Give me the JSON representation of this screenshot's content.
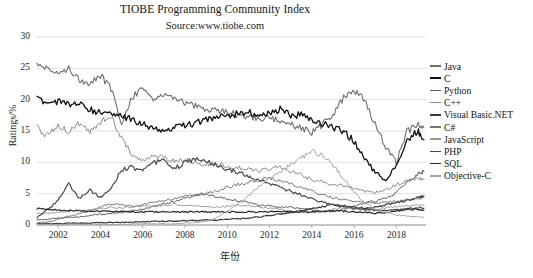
{
  "chart_data": {
    "type": "line",
    "title": "TIOBE Programming Community Index",
    "subtitle": "Source:www.tiobe.com",
    "xlabel": "年份",
    "ylabel": "Ratings/%",
    "xlim": [
      2001.0,
      2019.4
    ],
    "ylim": [
      0,
      30
    ],
    "yticks": [
      0,
      5,
      10,
      15,
      20,
      25,
      30
    ],
    "xticks": [
      2002,
      2004,
      2006,
      2008,
      2010,
      2012,
      2014,
      2016,
      2018
    ],
    "grid": true,
    "grid_axis": "y",
    "legend_position": "right",
    "x": [
      2001.0,
      2001.5,
      2002.0,
      2002.5,
      2003.0,
      2003.5,
      2004.0,
      2004.5,
      2005.0,
      2005.5,
      2006.0,
      2006.5,
      2007.0,
      2007.5,
      2008.0,
      2008.5,
      2009.0,
      2009.5,
      2010.0,
      2010.5,
      2011.0,
      2011.5,
      2012.0,
      2012.5,
      2013.0,
      2013.5,
      2014.0,
      2014.5,
      2015.0,
      2015.5,
      2016.0,
      2016.5,
      2017.0,
      2017.5,
      2018.0,
      2018.5,
      2019.0,
      2019.3
    ],
    "series": [
      {
        "name": "Java",
        "color": "#6f6f6f",
        "width": 1.1,
        "values": [
          26.0,
          24.8,
          24.2,
          25.1,
          23.3,
          22.6,
          23.9,
          21.8,
          16.4,
          20.5,
          21.9,
          20.0,
          21.0,
          20.4,
          19.6,
          19.0,
          18.5,
          18.2,
          18.0,
          17.5,
          17.2,
          17.0,
          17.2,
          16.6,
          16.2,
          15.4,
          14.8,
          16.0,
          17.8,
          20.3,
          21.5,
          20.0,
          16.0,
          12.5,
          10.0,
          14.9,
          16.0,
          15.5
        ]
      },
      {
        "name": "C",
        "color": "#101010",
        "width": 1.3,
        "values": [
          20.2,
          19.4,
          19.8,
          19.1,
          19.5,
          18.4,
          18.0,
          17.6,
          17.3,
          16.8,
          16.1,
          15.6,
          14.6,
          15.5,
          15.9,
          16.2,
          16.8,
          17.2,
          17.4,
          17.8,
          18.1,
          17.5,
          17.8,
          18.5,
          17.4,
          17.6,
          16.9,
          16.2,
          15.6,
          15.0,
          13.4,
          10.5,
          8.4,
          7.2,
          9.5,
          13.4,
          15.1,
          13.6
        ]
      },
      {
        "name": "Python",
        "color": "#5a5a5a",
        "width": 1.0,
        "values": [
          0.8,
          0.9,
          1.1,
          1.2,
          1.3,
          1.5,
          1.7,
          1.8,
          2.0,
          2.3,
          2.5,
          2.9,
          3.4,
          3.8,
          4.3,
          4.7,
          4.9,
          4.5,
          4.2,
          3.9,
          3.6,
          3.2,
          3.0,
          2.8,
          2.9,
          2.6,
          2.4,
          2.2,
          2.1,
          2.4,
          3.1,
          3.5,
          3.8,
          4.2,
          5.2,
          6.8,
          8.2,
          8.5
        ]
      },
      {
        "name": "C++",
        "color": "#8c8c8c",
        "width": 1.0,
        "values": [
          15.6,
          14.2,
          15.8,
          14.9,
          16.2,
          15.0,
          16.5,
          17.2,
          14.0,
          11.0,
          10.5,
          11.2,
          10.8,
          10.2,
          10.4,
          10.0,
          9.6,
          9.8,
          9.4,
          9.1,
          8.9,
          8.6,
          9.0,
          9.3,
          8.6,
          8.0,
          7.2,
          6.8,
          6.5,
          6.2,
          5.8,
          5.4,
          5.2,
          5.6,
          6.4,
          7.0,
          7.5,
          7.3
        ]
      },
      {
        "name": "Visual Basic.NET",
        "color": "#3a3a3a",
        "width": 1.2,
        "values": [
          0.2,
          0.2,
          0.2,
          0.3,
          0.3,
          0.3,
          0.4,
          0.4,
          0.4,
          0.5,
          0.5,
          0.6,
          0.6,
          0.6,
          0.7,
          0.7,
          0.8,
          0.8,
          0.9,
          1.0,
          1.1,
          1.3,
          1.5,
          1.8,
          2.0,
          2.3,
          2.6,
          2.9,
          3.2,
          3.0,
          2.8,
          2.7,
          2.9,
          3.2,
          3.6,
          4.0,
          4.4,
          4.6
        ]
      },
      {
        "name": "C#",
        "color": "#767676",
        "width": 1.0,
        "values": [
          0.3,
          0.5,
          0.9,
          1.4,
          1.8,
          2.3,
          2.9,
          3.4,
          3.2,
          3.0,
          3.3,
          3.6,
          3.9,
          4.2,
          4.5,
          4.8,
          5.1,
          5.4,
          6.0,
          6.5,
          6.8,
          7.2,
          7.5,
          7.0,
          6.6,
          6.0,
          5.4,
          4.8,
          4.4,
          4.0,
          3.8,
          3.6,
          3.4,
          3.6,
          3.8,
          4.0,
          4.2,
          4.3
        ]
      },
      {
        "name": "JavaScript",
        "color": "#9a9a9a",
        "width": 1.0,
        "values": [
          1.8,
          1.9,
          2.0,
          2.2,
          2.4,
          2.5,
          2.6,
          2.8,
          2.7,
          2.9,
          3.1,
          3.0,
          3.2,
          3.3,
          3.1,
          3.0,
          2.9,
          2.8,
          3.0,
          3.2,
          3.1,
          2.9,
          2.7,
          2.5,
          2.3,
          2.1,
          2.0,
          2.2,
          2.5,
          2.7,
          2.6,
          2.4,
          2.5,
          2.7,
          2.9,
          3.1,
          3.2,
          3.1
        ]
      },
      {
        "name": "PHP",
        "color": "#4a4a4a",
        "width": 1.2,
        "values": [
          1.2,
          2.4,
          4.0,
          6.5,
          4.2,
          5.6,
          4.4,
          5.8,
          8.8,
          9.2,
          8.6,
          9.8,
          10.4,
          9.0,
          9.9,
          10.6,
          10.2,
          9.6,
          9.0,
          8.4,
          7.8,
          7.2,
          6.6,
          6.0,
          5.4,
          4.8,
          4.2,
          3.6,
          3.2,
          2.9,
          2.7,
          2.5,
          2.4,
          2.3,
          2.4,
          2.6,
          2.8,
          2.7
        ]
      },
      {
        "name": "SQL",
        "color": "#2b2b2b",
        "width": 1.2,
        "values": [
          2.6,
          2.5,
          2.4,
          2.3,
          2.3,
          2.2,
          2.2,
          2.2,
          2.1,
          2.1,
          2.1,
          2.1,
          2.1,
          2.1,
          2.1,
          2.1,
          2.1,
          2.1,
          2.1,
          2.1,
          2.1,
          2.1,
          2.1,
          2.1,
          2.1,
          2.1,
          2.1,
          2.2,
          2.3,
          2.2,
          2.1,
          2.0,
          1.9,
          2.0,
          2.2,
          2.4,
          2.5,
          2.4
        ]
      },
      {
        "name": "Objective-C",
        "color": "#a5a5a5",
        "width": 1.0,
        "values": [
          0.1,
          0.1,
          0.1,
          0.1,
          0.1,
          0.1,
          0.1,
          0.1,
          0.1,
          0.2,
          0.2,
          0.2,
          0.2,
          0.2,
          0.3,
          0.4,
          0.6,
          1.2,
          2.2,
          3.4,
          4.6,
          6.2,
          7.4,
          8.4,
          9.6,
          10.8,
          11.8,
          11.2,
          9.6,
          7.4,
          5.2,
          3.6,
          2.6,
          2.0,
          1.6,
          1.4,
          1.3,
          1.2
        ]
      }
    ]
  },
  "axes": {
    "y_title": "Ratings/%",
    "x_title": "年份",
    "y_tick_labels": [
      "30",
      "25",
      "20",
      "15",
      "10",
      "5",
      "0"
    ],
    "x_tick_labels": [
      "2002",
      "2004",
      "2006",
      "2008",
      "2010",
      "2012",
      "2014",
      "2016",
      "2018"
    ]
  },
  "caption": ""
}
